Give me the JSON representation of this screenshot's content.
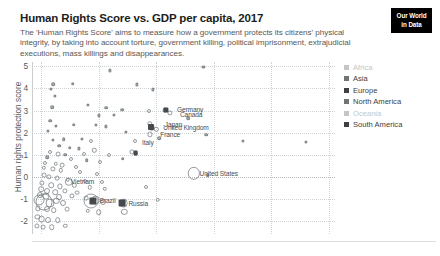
{
  "header": {
    "title": "Human Rights Score vs. GDP per capita, 2017",
    "subtitle": "The 'Human Rights Score' aims to measure how a government protects its citizens' physical integrity, by taking into account torture, government killing, political imprisonment, extrajudicial executions, mass killings and disappearances."
  },
  "logo": {
    "line1": "Our World",
    "line2": "in Data"
  },
  "legend": {
    "items": [
      {
        "label": "Africa",
        "color": "#c2c6c9",
        "muted": true
      },
      {
        "label": "Asia",
        "color": "#6f7477",
        "muted": false
      },
      {
        "label": "Europe",
        "color": "#3c4044",
        "muted": false
      },
      {
        "label": "North America",
        "color": "#6f7477",
        "muted": false
      },
      {
        "label": "Oceania",
        "color": "#c2c6c9",
        "muted": true
      },
      {
        "label": "South America",
        "color": "#3c4044",
        "muted": false
      }
    ]
  },
  "chart_data": {
    "type": "scatter",
    "title": "Human Rights Score vs. GDP per capita, 2017",
    "xlabel": "GDP per capita",
    "ylabel": "Human rights protection score",
    "x_scale": "log",
    "grid": true,
    "legend_position": "right",
    "ylim": [
      -2.6,
      5.2
    ],
    "yticks": [
      "5",
      "4",
      "3",
      "2",
      "1",
      "0",
      "-1",
      "-2"
    ],
    "ytick_values": [
      5,
      4,
      3,
      2,
      1,
      0,
      -1,
      -2
    ],
    "xtick_labels": [],
    "note": "x-axis tick labels are cropped out of the visible screenshot; bubble size encodes population",
    "vertical_gridlines_pct": [
      3,
      22,
      41,
      60,
      79,
      98
    ],
    "labeled_points": [
      {
        "label": "Germany",
        "x_pct": 46.5,
        "y": 3.05
      },
      {
        "label": "Canada",
        "x_pct": 47.5,
        "y": 2.86
      },
      {
        "label": "Japan",
        "x_pct": 42.5,
        "y": 2.4
      },
      {
        "label": "United Kingdom",
        "x_pct": 42.0,
        "y": 2.23
      },
      {
        "label": "France",
        "x_pct": 41.0,
        "y": 1.92
      },
      {
        "label": "Italy",
        "x_pct": 35.0,
        "y": 1.58
      },
      {
        "label": "United States",
        "x_pct": 54.0,
        "y": 0.16
      },
      {
        "label": "Vietnam",
        "x_pct": 11.5,
        "y": -0.2
      },
      {
        "label": "Brazil",
        "x_pct": 21.0,
        "y": -1.08
      },
      {
        "label": "Russia",
        "x_pct": 30.5,
        "y": -1.18
      }
    ],
    "points": [
      {
        "x_pct": 56.6,
        "y": 4.96,
        "r": 1.6
      },
      {
        "x_pct": 25.8,
        "y": 4.82,
        "r": 1.6
      },
      {
        "x_pct": 7.0,
        "y": 4.18,
        "r": 1.8
      },
      {
        "x_pct": 6.2,
        "y": 3.98,
        "r": 1.6
      },
      {
        "x_pct": 13.5,
        "y": 4.22,
        "r": 1.8
      },
      {
        "x_pct": 34.5,
        "y": 4.18,
        "r": 1.6
      },
      {
        "x_pct": 7.5,
        "y": 3.68,
        "r": 1.6
      },
      {
        "x_pct": 40.0,
        "y": 3.96,
        "r": 1.6
      },
      {
        "x_pct": 6.6,
        "y": 3.14,
        "r": 1.8
      },
      {
        "x_pct": 24.5,
        "y": 3.12,
        "r": 1.8
      },
      {
        "x_pct": 29.8,
        "y": 3.04,
        "r": 1.8
      },
      {
        "x_pct": 18.5,
        "y": 3.26,
        "r": 1.6
      },
      {
        "x_pct": 27.0,
        "y": 2.8,
        "r": 1.6
      },
      {
        "x_pct": 22.0,
        "y": 2.78,
        "r": 1.6
      },
      {
        "x_pct": 38.5,
        "y": 2.96,
        "r": 2.0
      },
      {
        "x_pct": 44.0,
        "y": 3.02,
        "r": 2.4
      },
      {
        "x_pct": 45.6,
        "y": 2.88,
        "r": 2.6
      },
      {
        "x_pct": 51.5,
        "y": 2.66,
        "r": 1.8
      },
      {
        "x_pct": 6.0,
        "y": 2.54,
        "r": 1.8
      },
      {
        "x_pct": 13.8,
        "y": 2.36,
        "r": 1.8
      },
      {
        "x_pct": 8.0,
        "y": 2.3,
        "r": 1.6
      },
      {
        "x_pct": 21.0,
        "y": 2.36,
        "r": 1.6
      },
      {
        "x_pct": 24.5,
        "y": 2.28,
        "r": 1.6
      },
      {
        "x_pct": 38.8,
        "y": 2.4,
        "r": 2.8
      },
      {
        "x_pct": 39.5,
        "y": 2.22,
        "r": 3.2
      },
      {
        "x_pct": 41.0,
        "y": 2.14,
        "r": 2.2
      },
      {
        "x_pct": 5.2,
        "y": 2.08,
        "r": 1.6
      },
      {
        "x_pct": 31.0,
        "y": 2.02,
        "r": 1.6
      },
      {
        "x_pct": 57.5,
        "y": 1.9,
        "r": 1.8
      },
      {
        "x_pct": 39.0,
        "y": 1.92,
        "r": 2.6
      },
      {
        "x_pct": 7.0,
        "y": 1.66,
        "r": 1.6
      },
      {
        "x_pct": 10.5,
        "y": 1.7,
        "r": 1.8
      },
      {
        "x_pct": 16.5,
        "y": 1.72,
        "r": 1.6
      },
      {
        "x_pct": 19.5,
        "y": 1.62,
        "r": 2.0
      },
      {
        "x_pct": 34.0,
        "y": 1.62,
        "r": 2.0
      },
      {
        "x_pct": 42.0,
        "y": 1.74,
        "r": 1.8
      },
      {
        "x_pct": 69.5,
        "y": 1.62,
        "r": 1.6
      },
      {
        "x_pct": 90.5,
        "y": 1.58,
        "r": 1.6
      },
      {
        "x_pct": 9.0,
        "y": 1.4,
        "r": 1.8
      },
      {
        "x_pct": 12.5,
        "y": 1.32,
        "r": 1.8
      },
      {
        "x_pct": 15.5,
        "y": 1.28,
        "r": 1.6
      },
      {
        "x_pct": 20.5,
        "y": 1.2,
        "r": 2.2
      },
      {
        "x_pct": 33.0,
        "y": 1.14,
        "r": 2.6
      },
      {
        "x_pct": 34.2,
        "y": 1.06,
        "r": 2.2
      },
      {
        "x_pct": 6.0,
        "y": 1.1,
        "r": 2.0
      },
      {
        "x_pct": 8.5,
        "y": 1.04,
        "r": 2.4
      },
      {
        "x_pct": 11.0,
        "y": 1.0,
        "r": 1.8
      },
      {
        "x_pct": 17.0,
        "y": 1.02,
        "r": 2.0
      },
      {
        "x_pct": 25.5,
        "y": 0.96,
        "r": 2.0
      },
      {
        "x_pct": 30.0,
        "y": 0.82,
        "r": 1.8
      },
      {
        "x_pct": 5.0,
        "y": 0.88,
        "r": 1.8
      },
      {
        "x_pct": 13.0,
        "y": 0.8,
        "r": 2.0
      },
      {
        "x_pct": 18.0,
        "y": 0.74,
        "r": 1.8
      },
      {
        "x_pct": 22.5,
        "y": 0.68,
        "r": 2.0
      },
      {
        "x_pct": 4.4,
        "y": 0.62,
        "r": 2.0
      },
      {
        "x_pct": 7.8,
        "y": 0.58,
        "r": 2.2
      },
      {
        "x_pct": 10.0,
        "y": 0.52,
        "r": 2.4
      },
      {
        "x_pct": 14.5,
        "y": 0.46,
        "r": 2.0
      },
      {
        "x_pct": 3.8,
        "y": 0.4,
        "r": 2.2
      },
      {
        "x_pct": 6.8,
        "y": 0.34,
        "r": 2.6
      },
      {
        "x_pct": 9.5,
        "y": 0.28,
        "r": 2.2
      },
      {
        "x_pct": 16.0,
        "y": 0.22,
        "r": 2.0
      },
      {
        "x_pct": 21.5,
        "y": 0.14,
        "r": 2.0
      },
      {
        "x_pct": 53.5,
        "y": 0.16,
        "r": 6.2
      },
      {
        "x_pct": 58.0,
        "y": 0.06,
        "r": 1.8
      },
      {
        "x_pct": 4.0,
        "y": 0.06,
        "r": 2.4
      },
      {
        "x_pct": 5.6,
        "y": -0.02,
        "r": 2.6
      },
      {
        "x_pct": 8.2,
        "y": -0.06,
        "r": 2.4
      },
      {
        "x_pct": 11.8,
        "y": -0.14,
        "r": 2.2
      },
      {
        "x_pct": 12.2,
        "y": -0.22,
        "r": 4.2
      },
      {
        "x_pct": 17.5,
        "y": -0.18,
        "r": 2.0
      },
      {
        "x_pct": 23.0,
        "y": -0.26,
        "r": 2.0
      },
      {
        "x_pct": 3.4,
        "y": -0.3,
        "r": 2.6
      },
      {
        "x_pct": 6.4,
        "y": -0.38,
        "r": 2.8
      },
      {
        "x_pct": 9.2,
        "y": -0.44,
        "r": 2.6
      },
      {
        "x_pct": 14.0,
        "y": -0.4,
        "r": 2.2
      },
      {
        "x_pct": 19.0,
        "y": -0.48,
        "r": 2.2
      },
      {
        "x_pct": 24.0,
        "y": -0.54,
        "r": 2.2
      },
      {
        "x_pct": 37.5,
        "y": -0.48,
        "r": 2.0
      },
      {
        "x_pct": 3.0,
        "y": -0.58,
        "r": 2.8
      },
      {
        "x_pct": 5.0,
        "y": -0.66,
        "r": 3.0
      },
      {
        "x_pct": 7.6,
        "y": -0.7,
        "r": 2.8
      },
      {
        "x_pct": 10.8,
        "y": -0.64,
        "r": 2.6
      },
      {
        "x_pct": 15.0,
        "y": -0.72,
        "r": 2.4
      },
      {
        "x_pct": 2.6,
        "y": -0.82,
        "r": 3.0
      },
      {
        "x_pct": 4.6,
        "y": -0.88,
        "r": 3.4
      },
      {
        "x_pct": 8.8,
        "y": -0.92,
        "r": 3.0
      },
      {
        "x_pct": 13.2,
        "y": -0.86,
        "r": 2.6
      },
      {
        "x_pct": 17.8,
        "y": -0.96,
        "r": 2.4
      },
      {
        "x_pct": 41.5,
        "y": -1.04,
        "r": 2.2
      },
      {
        "x_pct": 2.2,
        "y": -1.08,
        "r": 5.5
      },
      {
        "x_pct": 4.0,
        "y": -1.14,
        "r": 8.5
      },
      {
        "x_pct": 6.0,
        "y": -1.18,
        "r": 4.5
      },
      {
        "x_pct": 8.0,
        "y": -1.1,
        "r": 3.2
      },
      {
        "x_pct": 10.2,
        "y": -1.2,
        "r": 3.0
      },
      {
        "x_pct": 19.5,
        "y": -1.12,
        "r": 7.5
      },
      {
        "x_pct": 21.0,
        "y": -1.08,
        "r": 4.4
      },
      {
        "x_pct": 23.5,
        "y": -1.16,
        "r": 3.0
      },
      {
        "x_pct": 30.2,
        "y": -1.2,
        "r": 4.4
      },
      {
        "x_pct": 2.0,
        "y": -1.44,
        "r": 2.6
      },
      {
        "x_pct": 4.8,
        "y": -1.48,
        "r": 3.0
      },
      {
        "x_pct": 7.2,
        "y": -1.52,
        "r": 2.8
      },
      {
        "x_pct": 11.5,
        "y": -1.46,
        "r": 2.4
      },
      {
        "x_pct": 18.5,
        "y": -1.54,
        "r": 2.2
      },
      {
        "x_pct": 22.0,
        "y": -1.6,
        "r": 2.8
      },
      {
        "x_pct": 30.5,
        "y": -1.58,
        "r": 3.2
      },
      {
        "x_pct": 1.8,
        "y": -1.82,
        "r": 2.6
      },
      {
        "x_pct": 3.2,
        "y": -1.92,
        "r": 3.4
      },
      {
        "x_pct": 5.4,
        "y": -1.96,
        "r": 3.0
      },
      {
        "x_pct": 8.5,
        "y": -1.98,
        "r": 2.8
      },
      {
        "x_pct": 1.6,
        "y": -2.22,
        "r": 2.6
      },
      {
        "x_pct": 3.6,
        "y": -2.3,
        "r": 2.4
      },
      {
        "x_pct": 6.5,
        "y": -2.28,
        "r": 2.8
      },
      {
        "x_pct": 11.0,
        "y": -2.24,
        "r": 2.2
      }
    ],
    "highlighted_points": [
      {
        "label": "Brazil",
        "x_pct": 20.2,
        "y": -1.1,
        "r": 3.6
      },
      {
        "label": "Russia",
        "x_pct": 29.8,
        "y": -1.2,
        "r": 3.4
      },
      {
        "label": "United Kingdom",
        "x_pct": 39.2,
        "y": 2.24,
        "r": 3.0
      },
      {
        "label": "Germany",
        "x_pct": 44.3,
        "y": 3.02,
        "r": 2.6
      },
      {
        "label": "Italy",
        "x_pct": 34.2,
        "y": 1.08,
        "r": 2.4
      }
    ]
  }
}
